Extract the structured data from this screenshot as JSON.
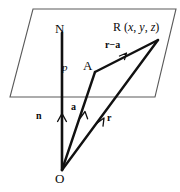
{
  "figure": {
    "background_color": "#ffffff",
    "stroke_color": "#111111",
    "plane_edge_color": "#5a5a5a"
  },
  "labels": {
    "point_N": "N",
    "point_A": "A",
    "point_O": "O",
    "point_R": "R",
    "coordinates": "(x, y, z)",
    "coord_x": "x",
    "coord_y": "y",
    "coord_z": "z",
    "scalar_p": "p",
    "vector_n": "n",
    "vector_a": "a",
    "vector_r": "r",
    "vector_r_minus_a": "r−a"
  },
  "geometry": {
    "plane_corners": [
      [
        33,
        9
      ],
      [
        176,
        9
      ],
      [
        155,
        97
      ],
      [
        10,
        97
      ]
    ],
    "origin": [
      62,
      170
    ],
    "point_N": [
      62,
      33
    ],
    "point_A": [
      95,
      72
    ],
    "point_R": [
      158,
      40
    ],
    "normal_line": [
      [
        62,
        33
      ],
      [
        62,
        170
      ]
    ],
    "vector_a_path": [
      [
        62,
        170
      ],
      [
        95,
        72
      ]
    ],
    "vector_r_path": [
      [
        62,
        170
      ],
      [
        158,
        40
      ]
    ],
    "vector_r_minus_a_path": [
      [
        95,
        72
      ],
      [
        158,
        40
      ]
    ]
  }
}
